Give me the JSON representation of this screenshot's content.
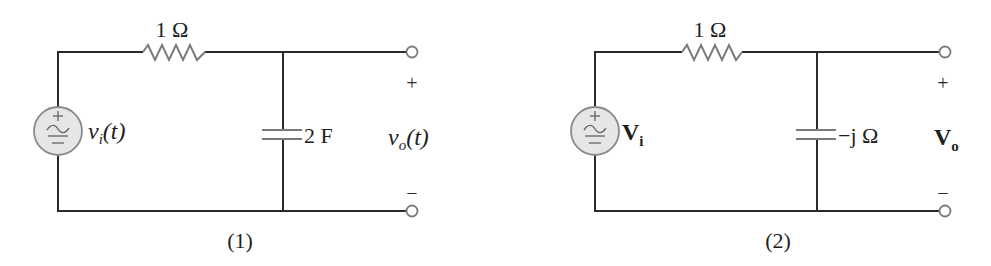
{
  "figure": {
    "circuits": [
      {
        "id": "1",
        "caption": "(1)",
        "source": {
          "symbol": "ac-voltage-source",
          "label_main": "v",
          "label_sub": "i",
          "label_suffix": "(t)",
          "plus": "+",
          "minus": "−"
        },
        "resistor": {
          "label": "1 Ω"
        },
        "capacitor": {
          "label": "2 F"
        },
        "output": {
          "plus": "+",
          "minus": "−",
          "label_main": "v",
          "label_sub": "o",
          "label_suffix": "(t)"
        }
      },
      {
        "id": "2",
        "caption": "(2)",
        "source": {
          "symbol": "ac-voltage-source",
          "label_main": "V",
          "label_sub": "i",
          "plus": "+",
          "minus": "−"
        },
        "resistor": {
          "label": "1 Ω"
        },
        "capacitor": {
          "label": "−j Ω"
        },
        "output": {
          "plus": "+",
          "minus": "−",
          "label_main": "V",
          "label_sub": "o"
        }
      }
    ]
  }
}
